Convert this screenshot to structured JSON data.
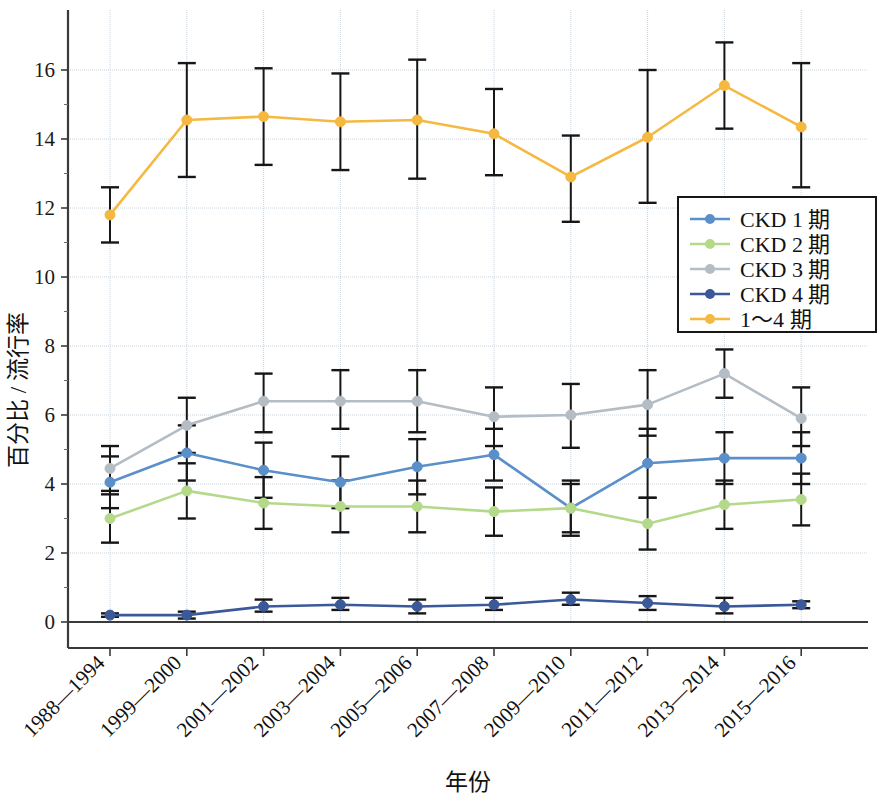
{
  "chart_data": {
    "type": "line",
    "title": "",
    "xlabel": "年份",
    "ylabel": "百分比 / 流行率",
    "ylim": [
      0,
      17.6
    ],
    "yticks": [
      0,
      2,
      4,
      6,
      8,
      10,
      12,
      14,
      16
    ],
    "grid": true,
    "legend_position": "right-middle",
    "error_bars": true,
    "categories": [
      "1988—1994",
      "1999—2000",
      "2001—2002",
      "2003—2004",
      "2005—2006",
      "2007—2008",
      "2009—2010",
      "2011—2012",
      "2013—2014",
      "2015—2016"
    ],
    "series": [
      {
        "name": "CKD 1 期",
        "color": "#5b8fc9",
        "values": [
          4.05,
          4.9,
          4.4,
          4.05,
          4.5,
          4.85,
          3.3,
          4.6,
          4.75,
          4.75
        ],
        "err_low": [
          3.3,
          4.1,
          3.6,
          3.3,
          3.7,
          4.1,
          2.6,
          3.6,
          4.0,
          4.0
        ],
        "err_high": [
          4.8,
          5.7,
          5.2,
          4.8,
          5.3,
          5.6,
          4.0,
          5.6,
          5.5,
          5.5
        ]
      },
      {
        "name": "CKD 2 期",
        "color": "#b5d98a",
        "values": [
          3.0,
          3.8,
          3.45,
          3.35,
          3.35,
          3.2,
          3.3,
          2.85,
          3.4,
          3.55
        ],
        "err_low": [
          2.3,
          3.0,
          2.7,
          2.6,
          2.6,
          2.5,
          2.5,
          2.1,
          2.7,
          2.8
        ],
        "err_high": [
          3.7,
          4.6,
          4.2,
          4.1,
          4.1,
          3.9,
          4.1,
          3.6,
          4.1,
          4.3
        ]
      },
      {
        "name": "CKD 3 期",
        "color": "#b4bcc4",
        "values": [
          4.45,
          5.7,
          6.4,
          6.4,
          6.4,
          5.95,
          6.0,
          6.3,
          7.2,
          5.9
        ],
        "err_low": [
          3.8,
          4.9,
          5.5,
          5.6,
          5.5,
          5.1,
          5.05,
          5.4,
          6.5,
          5.1
        ],
        "err_high": [
          5.1,
          6.5,
          7.2,
          7.3,
          7.3,
          6.8,
          6.9,
          7.3,
          7.9,
          6.8
        ]
      },
      {
        "name": "CKD 4 期",
        "color": "#3b5998",
        "values": [
          0.2,
          0.2,
          0.45,
          0.5,
          0.45,
          0.5,
          0.65,
          0.55,
          0.45,
          0.5
        ],
        "err_low": [
          0.15,
          0.1,
          0.3,
          0.35,
          0.25,
          0.35,
          0.5,
          0.35,
          0.25,
          0.4
        ],
        "err_high": [
          0.25,
          0.3,
          0.65,
          0.7,
          0.65,
          0.7,
          0.85,
          0.75,
          0.7,
          0.6
        ]
      },
      {
        "name": "1～4 期",
        "color": "#f5b942",
        "values": [
          11.8,
          14.55,
          14.65,
          14.5,
          14.55,
          14.15,
          12.9,
          14.05,
          15.55,
          14.35
        ],
        "err_low": [
          11.0,
          12.9,
          13.25,
          13.1,
          12.85,
          12.95,
          11.6,
          12.15,
          14.3,
          12.6
        ],
        "err_high": [
          12.6,
          16.2,
          16.05,
          15.9,
          16.3,
          15.45,
          14.1,
          16.0,
          16.8,
          16.2
        ]
      }
    ]
  },
  "legend": {
    "items": [
      {
        "label": "CKD 1 期",
        "color": "#5b8fc9"
      },
      {
        "label": "CKD 2 期",
        "color": "#b5d98a"
      },
      {
        "label": "CKD 3 期",
        "color": "#b4bcc4"
      },
      {
        "label": "CKD 4 期",
        "color": "#3b5998"
      },
      {
        "label": "1～4 期",
        "color": "#f5b942"
      }
    ]
  }
}
